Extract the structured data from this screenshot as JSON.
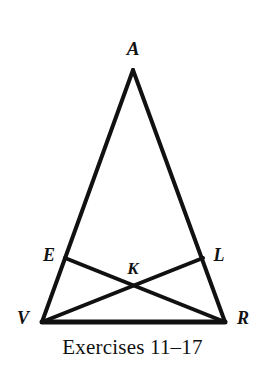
{
  "figure": {
    "kind": "geometry-diagram",
    "caption": "Exercises 11–17",
    "stroke_color": "#111111",
    "background_color": "#ffffff",
    "stroke_width": 4,
    "baseline_stroke_width": 5,
    "canvas": {
      "width": 265,
      "height": 367
    },
    "points": [
      {
        "id": "A",
        "label": "A",
        "x": 133,
        "y": 70,
        "label_x": 133,
        "label_y": 48,
        "role": "apex-vertex"
      },
      {
        "id": "E",
        "label": "E",
        "x": 65,
        "y": 258,
        "label_x": 49,
        "label_y": 255,
        "role": "point-on-side-AV"
      },
      {
        "id": "L",
        "label": "L",
        "x": 203,
        "y": 258,
        "label_x": 219,
        "label_y": 255,
        "role": "point-on-side-AR"
      },
      {
        "id": "K",
        "label": "K",
        "x": 133,
        "y": 288,
        "label_x": 133,
        "label_y": 268,
        "role": "intersection-of-cevians"
      },
      {
        "id": "V",
        "label": "V",
        "x": 42,
        "y": 322,
        "label_x": 23,
        "label_y": 318,
        "role": "base-left-vertex"
      },
      {
        "id": "R",
        "label": "R",
        "x": 225,
        "y": 322,
        "label_x": 243,
        "label_y": 318,
        "role": "base-right-vertex"
      }
    ],
    "segments": [
      {
        "id": "AV",
        "from": "A",
        "to": "V",
        "x1": 133,
        "y1": 70,
        "x2": 42,
        "y2": 322,
        "width": 4,
        "role": "triangle-side-left"
      },
      {
        "id": "AR",
        "from": "A",
        "to": "R",
        "x1": 133,
        "y1": 70,
        "x2": 225,
        "y2": 322,
        "width": 4,
        "role": "triangle-side-right"
      },
      {
        "id": "VR",
        "from": "V",
        "to": "R",
        "x1": 42,
        "y1": 322,
        "x2": 225,
        "y2": 322,
        "width": 5,
        "role": "triangle-base"
      },
      {
        "id": "ER",
        "from": "E",
        "to": "R",
        "x1": 65,
        "y1": 258,
        "x2": 225,
        "y2": 322,
        "width": 4,
        "role": "cevian"
      },
      {
        "id": "LV",
        "from": "L",
        "to": "V",
        "x1": 203,
        "y1": 258,
        "x2": 42,
        "y2": 322,
        "width": 4,
        "role": "cevian"
      }
    ]
  }
}
